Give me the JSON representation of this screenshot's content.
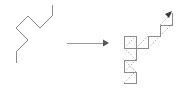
{
  "figure": {
    "background": "#ffffff",
    "width": 180,
    "height": 91,
    "colors": {
      "solid_line": "#8c8c8c",
      "dashed_line": "#b4b4b4",
      "arrow_shaft": "#999999",
      "arrow_head": "#555555",
      "tip_marker": "#3a3a3a"
    }
  },
  "left_shape": {
    "label": "input zigzag polyline",
    "stroke_style": "solid",
    "segment_count": 8,
    "points": "16,63 16,52 28,40 16,28 28,16 40,28 52,16 52,5",
    "vertices": [
      {
        "x": 16,
        "y": 63
      },
      {
        "x": 16,
        "y": 52
      },
      {
        "x": 28,
        "y": 40
      },
      {
        "x": 16,
        "y": 28
      },
      {
        "x": 28,
        "y": 16
      },
      {
        "x": 40,
        "y": 28
      },
      {
        "x": 52,
        "y": 16
      },
      {
        "x": 52,
        "y": 5
      }
    ]
  },
  "arrow": {
    "label": "maps to",
    "direction": "right",
    "shaft": {
      "x1": 67,
      "y1": 43,
      "x2": 103,
      "y2": 43
    },
    "head": "103,39.5 109,43 103,46.5"
  },
  "right_shape": {
    "label": "output curve with subdivided right triangles",
    "original_path_style": "dashed",
    "new_path_style": "solid",
    "original_points": "124,83 124,72 136,60 124,48 136,36 148,48 160,36 160,25",
    "solid_path": "124,83 136,83 136,72 124,72 124,60 136,60 136,48 124,48 124,36 136,36 136,48 148,48 148,36 160,36 160,25 172,25 172,13",
    "dashed_segments": [
      {
        "x1": 124,
        "y1": 83,
        "x2": 136,
        "y2": 71
      },
      {
        "x1": 136,
        "y1": 72,
        "x2": 124,
        "y2": 60
      },
      {
        "x1": 124,
        "y1": 72,
        "x2": 136,
        "y2": 60
      },
      {
        "x1": 136,
        "y1": 60,
        "x2": 124,
        "y2": 48
      },
      {
        "x1": 124,
        "y1": 48,
        "x2": 136,
        "y2": 36
      },
      {
        "x1": 136,
        "y1": 48,
        "x2": 148,
        "y2": 36
      },
      {
        "x1": 148,
        "y1": 48,
        "x2": 160,
        "y2": 36
      },
      {
        "x1": 160,
        "y1": 36,
        "x2": 172,
        "y2": 24
      },
      {
        "x1": 160,
        "y1": 25,
        "x2": 172,
        "y2": 13
      }
    ],
    "tip_marker": {
      "points": "165,14 172,11 169,18",
      "location": "top-right"
    }
  }
}
